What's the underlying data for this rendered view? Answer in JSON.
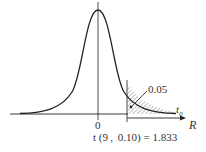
{
  "diagram": {
    "type": "t-distribution-curve",
    "origin_label": "0",
    "axis_label": "R",
    "critical_label": "t",
    "critical_subscript": "0",
    "tail_area_label": "0.05",
    "formula_label": "t (9 ,  0.10) = 1.833",
    "colors": {
      "stroke": "#222222",
      "hatch": "#555555"
    }
  }
}
